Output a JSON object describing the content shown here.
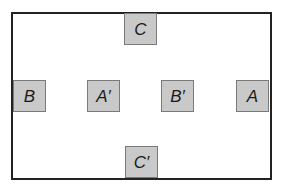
{
  "diagram": {
    "colors": {
      "frame_border": "#222222",
      "box_fill": "#c9c9c9",
      "box_border": "#7a7a7a",
      "label_text": "#1a1a1a"
    },
    "boxes": [
      {
        "id": "C",
        "label": "C",
        "position": "top-center"
      },
      {
        "id": "B",
        "label": "B",
        "position": "middle-left"
      },
      {
        "id": "A_prime",
        "label": "A′",
        "position": "middle-inner-left"
      },
      {
        "id": "B_prime",
        "label": "B′",
        "position": "middle-inner-right"
      },
      {
        "id": "A",
        "label": "A",
        "position": "middle-right"
      },
      {
        "id": "C_prime",
        "label": "C′",
        "position": "bottom-center"
      }
    ]
  }
}
